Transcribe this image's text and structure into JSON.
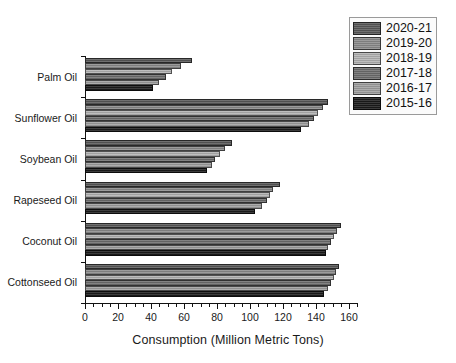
{
  "chart_data": {
    "type": "bar",
    "orientation": "horizontal",
    "title": "",
    "xlabel": "Consumption (Million Metric Tons)",
    "ylabel": "",
    "xlim": [
      0,
      165
    ],
    "ylim": [
      0,
      6
    ],
    "grid": false,
    "legend_position": "top-right",
    "categories": [
      "Palm Oil",
      "Sunflower Oil",
      "Soybean Oil",
      "Rapeseed Oil",
      "Coconut Oil",
      "Cottonseed Oil"
    ],
    "xticks": [
      0,
      20,
      40,
      60,
      80,
      100,
      120,
      140,
      160
    ],
    "xtick_labels": [
      "0",
      "20",
      "40",
      "60",
      "80",
      "100",
      "120",
      "140",
      "160"
    ],
    "minor_tick_interval": 5,
    "series": [
      {
        "name": "2020-21",
        "color": "#595959",
        "values": [
          65,
          147,
          89,
          118,
          155,
          154
        ]
      },
      {
        "name": "2019-20",
        "color": "#8c8c8c",
        "values": [
          58,
          144,
          85,
          114,
          153,
          152
        ]
      },
      {
        "name": "2018-19",
        "color": "#b3b3b3",
        "values": [
          53,
          141,
          82,
          112,
          151,
          151
        ]
      },
      {
        "name": "2017-18",
        "color": "#6e6e6e",
        "values": [
          49,
          139,
          79,
          110,
          149,
          149
        ]
      },
      {
        "name": "2016-17",
        "color": "#a0a0a0",
        "values": [
          45,
          136,
          77,
          107,
          147,
          147
        ]
      },
      {
        "name": "2015-16",
        "color": "#1c1c1c",
        "values": [
          41,
          131,
          74,
          103,
          146,
          145
        ]
      }
    ]
  },
  "legend": {
    "entries": [
      "2020-21",
      "2019-20",
      "2018-19",
      "2017-18",
      "2016-17",
      "2015-16"
    ]
  },
  "axis": {
    "x_title": "Consumption (Million Metric Tons)"
  }
}
